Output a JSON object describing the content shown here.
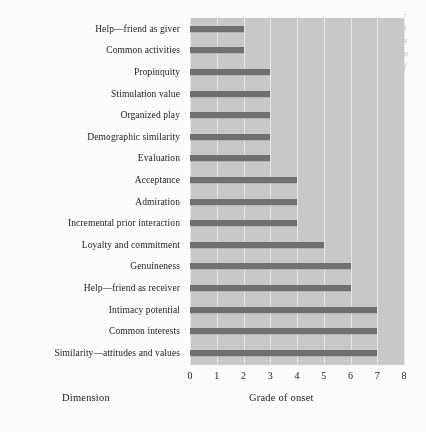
{
  "chart_data": {
    "type": "bar",
    "orientation": "horizontal",
    "title": "",
    "xlabel": "Grade of onset",
    "ylabel": "Dimension",
    "xlim": [
      0,
      8
    ],
    "xticks": [
      "0",
      "1",
      "2",
      "3",
      "4",
      "5",
      "6",
      "7",
      "8"
    ],
    "grid": "vertical",
    "legend": "none",
    "bar_color": "#6e6e6e",
    "panel_color": "#c9c9c9",
    "gridline_color": "#eceae6",
    "categories": [
      "Help—friend as giver",
      "Common activities",
      "Propinquity",
      "Stimulation value",
      "Organized play",
      "Demographic similarity",
      "Evaluation",
      "Acceptance",
      "Admiration",
      "Incremental prior interaction",
      "Loyalty and commitment",
      "Genuineness",
      "Help—friend as receiver",
      "Intimacy potential",
      "Common interests",
      "Similarity—attitudes and values"
    ],
    "values": [
      2,
      2,
      3,
      3,
      3,
      3,
      3,
      4,
      4,
      4,
      5,
      6,
      6,
      7,
      7,
      7
    ]
  },
  "margin_bleed": {
    "lines": [
      "i",
      "i",
      "s",
      "u",
      "f"
    ]
  }
}
